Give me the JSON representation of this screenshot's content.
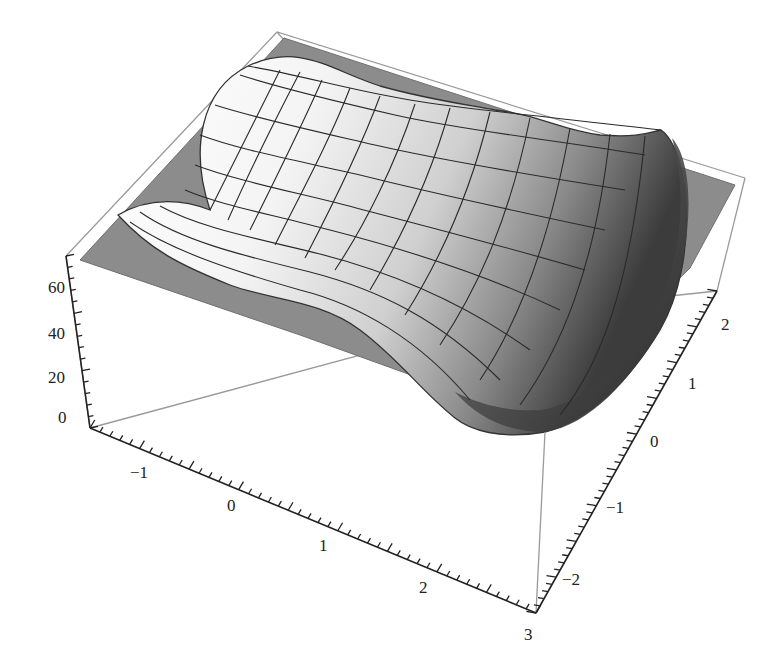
{
  "chart_data": {
    "type": "surface3d",
    "title": "",
    "x_axis": {
      "label": "",
      "range": [
        -1.5,
        3
      ],
      "ticks": [
        "-1",
        "0",
        "1",
        "2",
        "3"
      ]
    },
    "y_axis": {
      "label": "",
      "range": [
        -2.3,
        2.1
      ],
      "ticks": [
        "-2",
        "-1",
        "0",
        "1",
        "2"
      ]
    },
    "z_axis": {
      "label": "",
      "range": [
        -5,
        70
      ],
      "ticks": [
        "0",
        "20",
        "40",
        "60"
      ]
    },
    "plane": {
      "z": 10,
      "color": "#8c8c8c"
    },
    "mesh": {
      "lines_x": 15,
      "lines_y": 15
    },
    "box": true,
    "colors": {
      "surface_light": "#f7f7f7",
      "surface_dark": "#3a3a3a",
      "plane": "#8c8c8c",
      "box": "#9a9a9a",
      "axis": "#222222"
    }
  },
  "axes": {
    "z_ticks": [
      {
        "label": "60",
        "x": 60,
        "y": 288
      },
      {
        "label": "40",
        "x": 60,
        "y": 334
      },
      {
        "label": "20",
        "x": 60,
        "y": 378
      },
      {
        "label": "0",
        "x": 69,
        "y": 418
      }
    ],
    "x_ticks": [
      {
        "label": "−1",
        "x": 138,
        "y": 473
      },
      {
        "label": "0",
        "x": 230,
        "y": 506
      },
      {
        "label": "1",
        "x": 322,
        "y": 546
      },
      {
        "label": "2",
        "x": 422,
        "y": 588
      },
      {
        "label": "3",
        "x": 526,
        "y": 631
      }
    ],
    "y_ticks": [
      {
        "label": "2",
        "x": 725,
        "y": 335
      },
      {
        "label": "1",
        "x": 690,
        "y": 388
      },
      {
        "label": "0",
        "x": 650,
        "y": 450
      },
      {
        "label": "−1",
        "x": 608,
        "y": 515
      },
      {
        "label": "−2",
        "x": 566,
        "y": 588
      }
    ]
  }
}
